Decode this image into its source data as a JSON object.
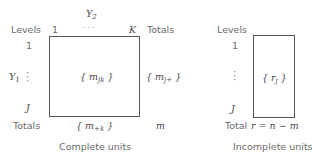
{
  "complete": {
    "col_var": "Y",
    "col_var_sub": "2",
    "row_var": "Y",
    "row_var_sub": "1",
    "levels_label": "Levels",
    "totals_col_label": "Totals",
    "totals_row_label": "Totals",
    "col_first": "1",
    "col_dots": "· · ·",
    "col_last": "K",
    "row_first": "1",
    "row_last": "J",
    "cell": "{ m",
    "cell_sub": "jk",
    "cell_close": "}",
    "row_total": "{ m",
    "row_total_sub": "j+",
    "row_total_close": "}",
    "col_total": "{ m",
    "col_total_sub": "+k",
    "col_total_close": "}",
    "grand_total": "m",
    "caption": "Complete units"
  },
  "incomplete": {
    "levels_label": "Levels",
    "row_first": "1",
    "row_last": "J",
    "cell": "{ r",
    "cell_sub": "j",
    "cell_close": "}",
    "total_label": "Total",
    "total_expr": "r = n − m",
    "caption": "Incomplete units"
  }
}
